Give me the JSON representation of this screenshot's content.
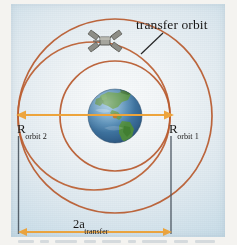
{
  "figure": {
    "background_color": "#cfe0ea",
    "page_color": "#ffffff"
  },
  "labels": {
    "transfer_orbit": "transfer orbit",
    "r_orbit_2_base": "R",
    "r_orbit_2_sub": "orbit 2",
    "r_orbit_1_base": "R",
    "r_orbit_1_sub": "orbit 1",
    "semi_major_base": "2a",
    "semi_major_sub": "transfer"
  },
  "colors": {
    "orbit_line": "#b85a2e",
    "orbit_line_light": "#c9713f",
    "arrow": "#eda43c",
    "extension_line": "#4a5560",
    "leader_line": "#2b2b2b",
    "earth_ocean": "#3f78a8",
    "earth_ocean_deep": "#2d5b84",
    "earth_land": "#4f8c3a",
    "earth_land_dark": "#36682a",
    "satellite_body": "#9a9a93",
    "satellite_panel": "#6f6f68"
  },
  "geometry": {
    "center_x": 115,
    "center_y": 116,
    "earth_radius": 27,
    "orbit1_radius": 55,
    "orbit2_radius": 97,
    "transfer_semi_major": 76,
    "transfer_semi_minor": 73,
    "transfer_center_x": 94,
    "radius_arrow_y": 115,
    "major_axis_arrow_y": 232,
    "extension_left_x": 18,
    "extension_right_x": 171,
    "extension_top_y": 133,
    "extension_bottom_y": 234
  },
  "elements": {
    "satellite": {
      "x": 105,
      "y": 41,
      "name": "satellite"
    },
    "earth": {
      "name": "earth-globe"
    },
    "orbit_inner": {
      "name": "orbit-1-circle"
    },
    "orbit_outer": {
      "name": "orbit-2-circle"
    },
    "transfer_ellipse": {
      "name": "transfer-orbit-ellipse"
    }
  }
}
